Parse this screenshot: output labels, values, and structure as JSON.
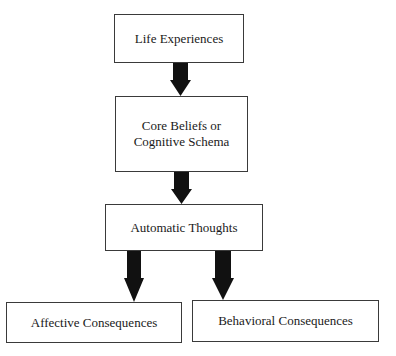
{
  "diagram": {
    "type": "flowchart",
    "nodes": {
      "life_experiences": {
        "label": "Life Experiences"
      },
      "core_beliefs": {
        "lines": [
          "Core Beliefs or",
          "Cognitive Schema"
        ]
      },
      "automatic_thoughts": {
        "label": "Automatic Thoughts"
      },
      "affective_consequences": {
        "label": "Affective Consequences"
      },
      "behavioral_consequences": {
        "label": "Behavioral Consequences"
      }
    },
    "edges": [
      {
        "from": "Life Experiences",
        "to": "Core Beliefs or Cognitive Schema"
      },
      {
        "from": "Core Beliefs or Cognitive Schema",
        "to": "Automatic Thoughts"
      },
      {
        "from": "Automatic Thoughts",
        "to": "Affective Consequences"
      },
      {
        "from": "Automatic Thoughts",
        "to": "Behavioral Consequences"
      }
    ],
    "colors": {
      "border": "#3a3a3a",
      "arrow": "#111111",
      "background": "#ffffff"
    }
  }
}
